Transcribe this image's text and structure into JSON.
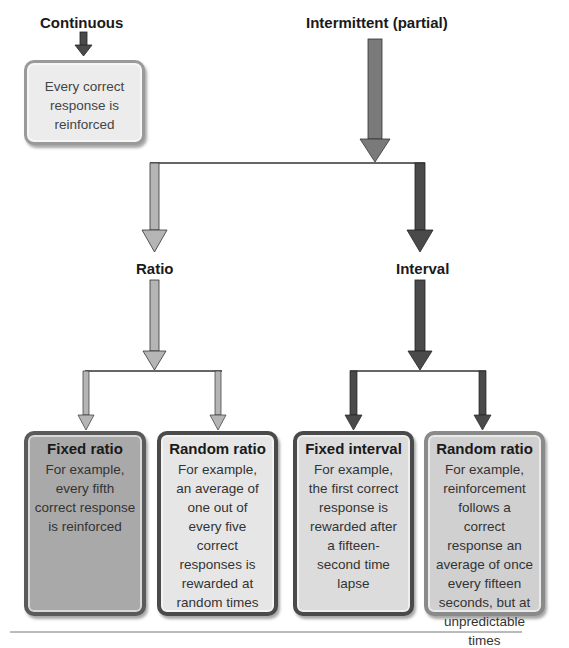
{
  "diagram": {
    "type": "hierarchy",
    "top_level": {
      "continuous": {
        "label": "Continuous",
        "description": "Every correct response is reinforced"
      },
      "intermittent": {
        "label": "Intermittent (partial)"
      }
    },
    "second_level": {
      "ratio": {
        "label": "Ratio"
      },
      "interval": {
        "label": "Interval"
      }
    },
    "leaves": [
      {
        "title": "Fixed ratio",
        "parent": "Ratio",
        "description": "For example, every fifth correct response is reinforced",
        "fill": "#a9a9a9",
        "border": "#5a5a5a"
      },
      {
        "title": "Random ratio",
        "parent": "Ratio",
        "description": "For example, an average of one out of every five correct responses is rewarded at random times",
        "fill": "#e6e6e6",
        "border": "#4a4a4a"
      },
      {
        "title": "Fixed interval",
        "parent": "Interval",
        "description": "For example, the first correct response is rewarded after a fifteen-second time lapse",
        "fill": "#dcdcdc",
        "border": "#4a4a4a"
      },
      {
        "title": "Random ratio",
        "parent": "Interval",
        "description": "For example, reinforcement follows a correct response an average of once every fifteen seconds, but at unpredictable times",
        "fill": "#d0d0d0",
        "border": "#8a8a8a"
      }
    ],
    "colors": {
      "light_arrow": "#b5b5b5",
      "medium_arrow": "#7a7a7a",
      "dark_arrow": "#4a4a4a",
      "connector_line": "#333333",
      "continuous_box_fill": "#ececec",
      "continuous_box_border": "#9a9a9a"
    }
  }
}
